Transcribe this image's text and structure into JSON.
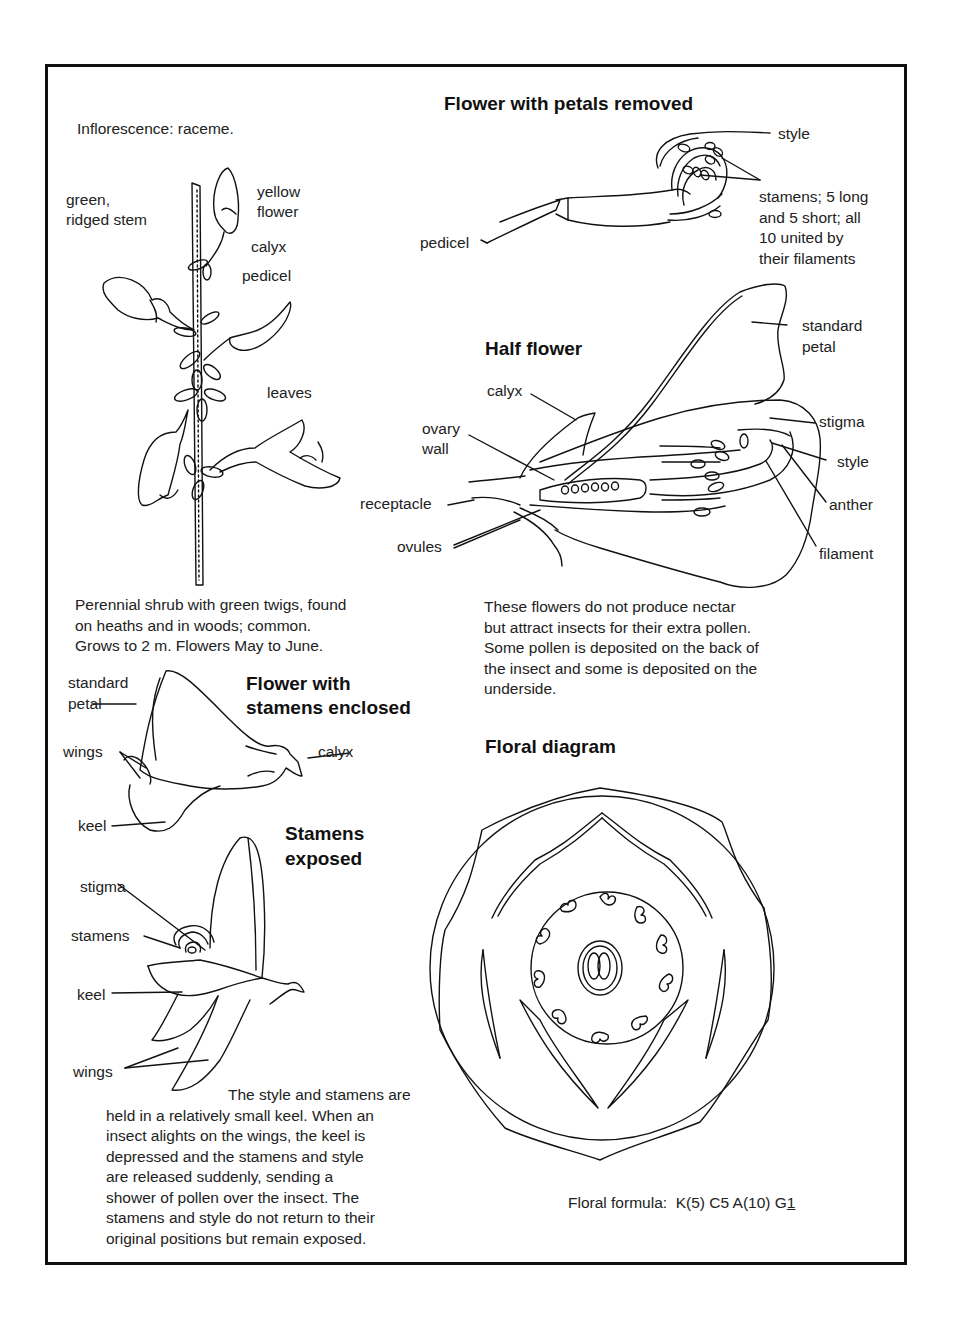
{
  "inflorescence": "Inflorescence: raceme.",
  "raceme_labels": {
    "stem_l1": "green,",
    "stem_l2": "ridged stem",
    "flower_l1": "yellow",
    "flower_l2": "flower",
    "calyx": "calyx",
    "pedicel": "pedicel",
    "leaves": "leaves"
  },
  "description": [
    "Perennial shrub with green twigs, found",
    "on heaths and in woods; common.",
    "Grows to 2 m. Flowers May to June."
  ],
  "petals_removed": {
    "title": "Flower with petals removed",
    "style": "style",
    "pedicel": "pedicel",
    "stamens": [
      "stamens; 5 long",
      "and 5 short; all",
      "10 united by",
      "their filaments"
    ]
  },
  "half_flower": {
    "title": "Half flower",
    "standard_l1": "standard",
    "standard_l2": "petal",
    "calyx": "calyx",
    "ovary_l1": "ovary",
    "ovary_l2": "wall",
    "receptacle": "receptacle",
    "ovules": "ovules",
    "stigma": "stigma",
    "style": "style",
    "anther": "anther",
    "filament": "filament"
  },
  "pollination_note": [
    "These flowers do not produce nectar",
    "but attract insects for their extra pollen.",
    "Some pollen is deposited on the back of",
    "the insect and some is deposited on the",
    "underside."
  ],
  "enclosed": {
    "title_l1": "Flower with",
    "title_l2": "stamens enclosed",
    "standard_l1": "standard",
    "standard_l2": "petal",
    "wings": "wings",
    "calyx": "calyx",
    "keel": "keel"
  },
  "exposed": {
    "title_l1": "Stamens",
    "title_l2": "exposed",
    "stigma": "stigma",
    "stamens": "stamens",
    "keel": "keel",
    "wings": "wings"
  },
  "mechanism_note": [
    "The style and stamens are",
    "held in a relatively small keel. When an",
    "insect alights on the wings, the keel is",
    "depressed and the stamens and style",
    "are released suddenly, sending a",
    "shower of pollen over the insect. The",
    "stamens and style do not return to their",
    "original positions but remain exposed."
  ],
  "floral_diagram": {
    "title": "Floral diagram",
    "formula_label": "Floral formula:",
    "formula": "K(5) C5 A(10) G",
    "formula_gyn": "1"
  }
}
